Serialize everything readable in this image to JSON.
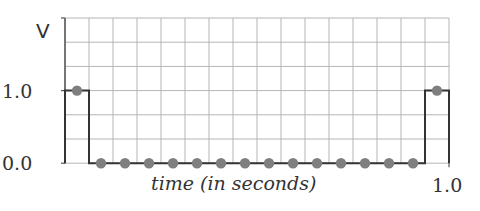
{
  "chart_data": {
    "type": "line",
    "style": "step-with-sample-dots",
    "title": "",
    "xlabel": "time (in seconds)",
    "ylabel": "V",
    "x_tick_labels": [
      "1.0"
    ],
    "y_tick_labels": [
      "0.0",
      "1.0"
    ],
    "xlim": [
      0,
      1.0
    ],
    "ylim": [
      0,
      2.0
    ],
    "grid": true,
    "grid_columns": 16,
    "grid_rows": 6,
    "series": [
      {
        "name": "V",
        "x": [
          0.03125,
          0.09375,
          0.15625,
          0.21875,
          0.28125,
          0.34375,
          0.40625,
          0.46875,
          0.53125,
          0.59375,
          0.65625,
          0.71875,
          0.78125,
          0.84375,
          0.90625,
          0.96875
        ],
        "values": [
          1,
          0,
          0,
          0,
          0,
          0,
          0,
          0,
          0,
          0,
          0,
          0,
          0,
          0,
          0,
          1
        ]
      }
    ],
    "colors": {
      "line": "#333333",
      "dots": "#7f7f7f",
      "grid": "#b5b5b5",
      "text": "#333333"
    }
  }
}
